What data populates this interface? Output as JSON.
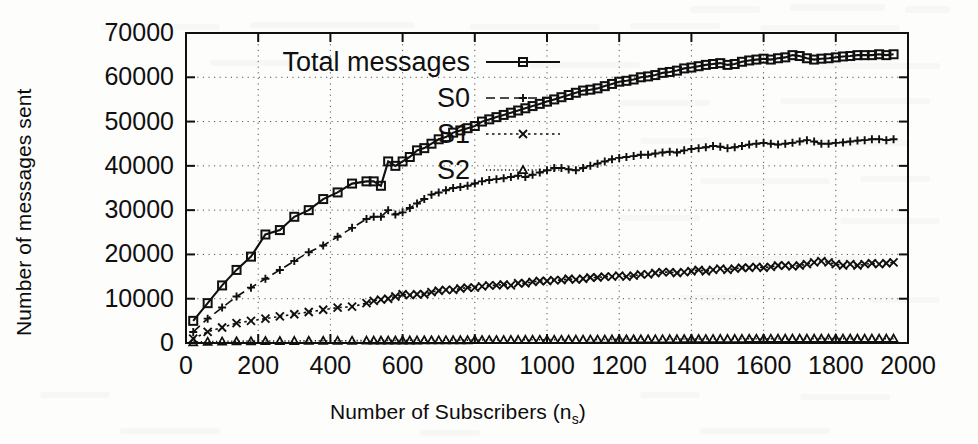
{
  "chart_data": {
    "type": "line",
    "title": "",
    "xlabel": "Number of Subscribers (n",
    "xlabel_sub": "s",
    "xlabel_tail": ")",
    "ylabel": "Number of messages sent",
    "xlim": [
      0,
      2000
    ],
    "ylim": [
      0,
      70000
    ],
    "xticks": [
      0,
      200,
      400,
      600,
      800,
      1000,
      1200,
      1400,
      1600,
      1800,
      2000
    ],
    "yticks": [
      0,
      10000,
      20000,
      30000,
      40000,
      50000,
      60000,
      70000
    ],
    "xtick_labels": [
      "0",
      "200",
      "400",
      "600",
      "800",
      "1000",
      "1200",
      "1400",
      "1600",
      "1800",
      "2000"
    ],
    "ytick_labels": [
      "0",
      "10000",
      "20000",
      "30000",
      "40000",
      "50000",
      "60000",
      "70000"
    ],
    "grid": true,
    "grid_style": "dotted",
    "legend_position": "top-left-inside",
    "line_color": "#101010",
    "x": [
      20,
      60,
      100,
      140,
      180,
      220,
      260,
      300,
      340,
      380,
      420,
      460,
      500,
      520,
      540,
      560,
      580,
      600,
      620,
      640,
      660,
      680,
      700,
      720,
      740,
      760,
      780,
      800,
      820,
      840,
      860,
      880,
      900,
      920,
      940,
      960,
      980,
      1000,
      1020,
      1040,
      1060,
      1080,
      1100,
      1120,
      1140,
      1160,
      1180,
      1200,
      1220,
      1240,
      1260,
      1280,
      1300,
      1320,
      1340,
      1360,
      1380,
      1400,
      1420,
      1440,
      1460,
      1480,
      1500,
      1520,
      1540,
      1560,
      1580,
      1600,
      1620,
      1640,
      1660,
      1680,
      1700,
      1720,
      1740,
      1760,
      1780,
      1800,
      1820,
      1840,
      1860,
      1880,
      1900,
      1920,
      1940,
      1960
    ],
    "series": [
      {
        "name": "Total messages",
        "marker": "square",
        "dash": "solid",
        "values": [
          5000,
          9000,
          13000,
          16500,
          19500,
          24500,
          25500,
          28500,
          30000,
          32500,
          34000,
          36000,
          36500,
          36500,
          35500,
          41000,
          40000,
          41000,
          42000,
          43500,
          44000,
          45000,
          46000,
          46500,
          47500,
          48000,
          48500,
          49000,
          50000,
          50500,
          51000,
          51500,
          52000,
          52500,
          53000,
          53500,
          54000,
          54500,
          55000,
          55500,
          56000,
          56500,
          57000,
          57200,
          57500,
          58000,
          58500,
          59000,
          59200,
          59500,
          60000,
          60200,
          60500,
          61000,
          61200,
          61500,
          62000,
          62200,
          62500,
          62800,
          63000,
          63200,
          62800,
          63000,
          63500,
          63800,
          64000,
          64200,
          64000,
          64300,
          64500,
          65000,
          64800,
          64300,
          64000,
          64200,
          64300,
          64500,
          64700,
          64800,
          65000,
          65000,
          65000,
          65200,
          65000,
          65200
        ]
      },
      {
        "name": "S0",
        "marker": "plus",
        "dash": "dashed",
        "values": [
          2500,
          5500,
          8000,
          10500,
          12500,
          14500,
          16500,
          18500,
          20500,
          22000,
          24000,
          26000,
          28000,
          28500,
          28500,
          30000,
          29000,
          29500,
          30500,
          31500,
          32500,
          33500,
          34000,
          34500,
          35000,
          35200,
          35500,
          36000,
          36500,
          36800,
          37000,
          37200,
          37500,
          37800,
          37500,
          38000,
          38500,
          39000,
          39500,
          39500,
          39200,
          39000,
          39500,
          40000,
          40500,
          41000,
          41500,
          41800,
          42000,
          42200,
          42500,
          42500,
          42800,
          43000,
          43200,
          43000,
          43500,
          43800,
          44000,
          44200,
          44500,
          44300,
          44000,
          44200,
          44500,
          44800,
          45000,
          45200,
          45000,
          44800,
          45000,
          45200,
          45500,
          45800,
          45500,
          45000,
          45000,
          45200,
          45300,
          45500,
          45700,
          45800,
          46000,
          46000,
          45800,
          46000
        ]
      },
      {
        "name": "S1",
        "marker": "cross",
        "dash": "dotted",
        "values": [
          1000,
          2500,
          3500,
          4500,
          5000,
          5500,
          6000,
          6500,
          7000,
          7500,
          8000,
          8200,
          9000,
          9500,
          9800,
          10000,
          10500,
          11000,
          10800,
          11000,
          11000,
          11500,
          11800,
          12000,
          12000,
          12300,
          12500,
          12500,
          12800,
          13000,
          13000,
          13200,
          13000,
          13500,
          13500,
          13800,
          14000,
          14000,
          14200,
          14200,
          14500,
          14300,
          14500,
          14800,
          14800,
          15000,
          15000,
          15200,
          15000,
          15200,
          15500,
          15500,
          15800,
          16000,
          16000,
          15800,
          16000,
          16200,
          16500,
          16200,
          16500,
          16800,
          16500,
          16800,
          17000,
          17000,
          17200,
          17000,
          17200,
          17500,
          17500,
          17300,
          17500,
          17800,
          18200,
          18500,
          18200,
          17800,
          17500,
          17800,
          17500,
          17800,
          18000,
          17800,
          18000,
          18200
        ]
      },
      {
        "name": "S2",
        "marker": "triangle",
        "dash": "fine-dotted",
        "values": [
          200,
          300,
          350,
          400,
          420,
          450,
          450,
          480,
          500,
          500,
          520,
          520,
          550,
          550,
          560,
          580,
          580,
          600,
          600,
          600,
          620,
          620,
          640,
          640,
          650,
          650,
          660,
          680,
          680,
          700,
          700,
          700,
          720,
          720,
          740,
          740,
          750,
          750,
          760,
          760,
          780,
          780,
          780,
          800,
          800,
          800,
          820,
          820,
          840,
          840,
          850,
          850,
          860,
          860,
          880,
          880,
          900,
          900,
          900,
          920,
          920,
          940,
          940,
          950,
          950,
          960,
          960,
          980,
          980,
          1000,
          1000,
          1000,
          1000,
          1000,
          1000,
          1000,
          1000,
          1000,
          1000,
          1000,
          1000,
          1000,
          1000,
          1000,
          1000,
          1000
        ]
      }
    ]
  },
  "legend": {
    "entries": [
      {
        "label": "Total messages",
        "marker": "square",
        "dash": "solid"
      },
      {
        "label": "S0",
        "marker": "plus",
        "dash": "dashed"
      },
      {
        "label": "S1",
        "marker": "cross",
        "dash": "dotted"
      },
      {
        "label": "S2",
        "marker": "triangle",
        "dash": "fine-dotted"
      }
    ]
  }
}
